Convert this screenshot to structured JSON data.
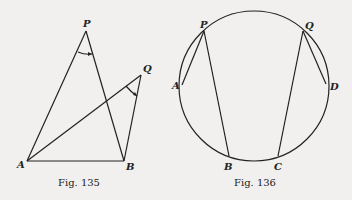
{
  "figures": [
    {
      "caption": "Fig. 135",
      "points": {
        "P": {
          "label": "P",
          "x": 86,
          "y": 31
        },
        "Q": {
          "label": "Q",
          "x": 141,
          "y": 75
        },
        "A": {
          "label": "A",
          "x": 27,
          "y": 161
        },
        "B": {
          "label": "B",
          "x": 124,
          "y": 161
        }
      },
      "segments": [
        "PA",
        "PB",
        "QA",
        "QB",
        "AB"
      ],
      "angle_marks": [
        "APB",
        "AQB"
      ]
    },
    {
      "caption": "Fig. 136",
      "circle": {
        "cx": 254,
        "cy": 86,
        "r": 75
      },
      "points": {
        "P": {
          "label": "P",
          "x": 204,
          "y": 31
        },
        "Q": {
          "label": "Q",
          "x": 303,
          "y": 31
        },
        "A": {
          "label": "A",
          "x": 182,
          "y": 85
        },
        "B": {
          "label": "B",
          "x": 229,
          "y": 156
        },
        "C": {
          "label": "C",
          "x": 278,
          "y": 156
        },
        "D": {
          "label": "D",
          "x": 326,
          "y": 84
        }
      },
      "segments": [
        "PA",
        "PB",
        "QC",
        "QD"
      ]
    }
  ]
}
